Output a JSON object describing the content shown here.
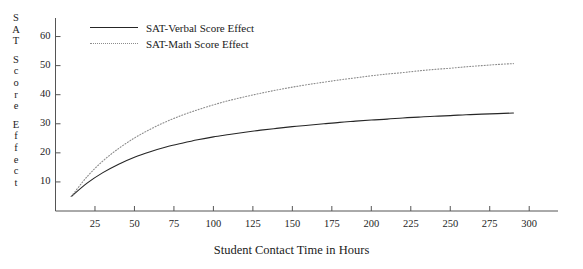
{
  "chart_data": {
    "type": "line",
    "title": "",
    "xlabel": "Student Contact Time in Hours",
    "ylabel": "SAT Score Effect",
    "ylabel_chars": [
      "S",
      "A",
      "T",
      "",
      "S",
      "c",
      "o",
      "r",
      "e",
      "",
      "E",
      "f",
      "f",
      "e",
      "c",
      "t"
    ],
    "xlim": [
      0,
      310
    ],
    "ylim": [
      0,
      65
    ],
    "xticks": [
      25,
      50,
      75,
      100,
      125,
      150,
      175,
      200,
      225,
      250,
      275,
      300
    ],
    "yticks": [
      10,
      20,
      30,
      40,
      50,
      60
    ],
    "grid": false,
    "legend_position": "top-left-inside",
    "axis_style": "left-and-bottom-spines",
    "colors": {
      "verbal_line": "#262626",
      "math_line": "#8c8c8c",
      "axis": "#555555",
      "text": "#1a1a1a",
      "background": "#ffffff"
    },
    "x": [
      10,
      20,
      30,
      40,
      50,
      60,
      70,
      80,
      90,
      100,
      110,
      120,
      130,
      140,
      150,
      160,
      170,
      180,
      190,
      200,
      210,
      220,
      230,
      240,
      250,
      260,
      270,
      280,
      290
    ],
    "series": [
      {
        "name": "SAT-Verbal Score Effect",
        "style": "solid",
        "color": "#262626",
        "values": [
          5.0,
          9.6,
          13.2,
          16.1,
          18.5,
          20.4,
          22.0,
          23.3,
          24.5,
          25.5,
          26.3,
          27.1,
          27.8,
          28.4,
          29.0,
          29.5,
          30.0,
          30.5,
          30.9,
          31.3,
          31.6,
          32.0,
          32.3,
          32.6,
          32.8,
          33.1,
          33.3,
          33.5,
          33.7
        ]
      },
      {
        "name": "SAT-Math Score Effect",
        "style": "dotted",
        "color": "#8c8c8c",
        "values": [
          5.0,
          11.8,
          17.2,
          21.5,
          25.1,
          28.1,
          30.7,
          32.9,
          34.8,
          36.5,
          38.0,
          39.3,
          40.5,
          41.6,
          42.6,
          43.5,
          44.3,
          45.1,
          45.8,
          46.5,
          47.1,
          47.6,
          48.2,
          48.7,
          49.1,
          49.6,
          50.0,
          50.4,
          50.7
        ]
      }
    ]
  },
  "legend": {
    "entries": [
      {
        "label": "SAT-Verbal Score Effect",
        "style": "solid"
      },
      {
        "label": "SAT-Math Score Effect",
        "style": "dotted"
      }
    ]
  }
}
